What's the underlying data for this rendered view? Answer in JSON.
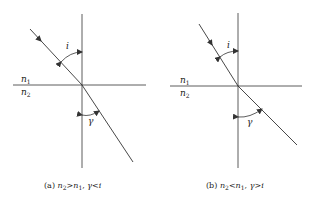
{
  "figures": [
    {
      "id": "a",
      "medium_top": "n",
      "medium_top_sub": "1",
      "medium_bottom": "n",
      "medium_bottom_sub": "2",
      "angle_incident": "i",
      "angle_refracted": "γ",
      "caption": {
        "tag": "(a)",
        "n2": "n",
        "n2_sub": "2",
        "rel1": ">",
        "n1": "n",
        "n1_sub": "1",
        "sep": ",",
        "gamma": "γ",
        "rel2": "<",
        "i": "i"
      }
    },
    {
      "id": "b",
      "medium_top": "n",
      "medium_top_sub": "1",
      "medium_bottom": "n",
      "medium_bottom_sub": "2",
      "angle_incident": "i",
      "angle_refracted": "γ",
      "caption": {
        "tag": "(b)",
        "n2": "n",
        "n2_sub": "2",
        "rel1": "<",
        "n1": "n",
        "n1_sub": "1",
        "sep": ",",
        "gamma": "γ",
        "rel2": ">",
        "i": "i"
      }
    }
  ],
  "colors": {
    "line": "#333333",
    "text": "#222222"
  }
}
